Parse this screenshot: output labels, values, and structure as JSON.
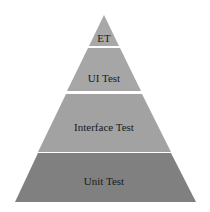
{
  "diagram": {
    "type": "test-pyramid",
    "layers": [
      {
        "label": "ET",
        "color": "#a8a8a8"
      },
      {
        "label": "UI Test",
        "color": "#a6a6a6"
      },
      {
        "label": "Interface Test",
        "color": "#a2a2a2"
      },
      {
        "label": "Unit Test",
        "color": "#808080"
      }
    ],
    "separator_color": "#ffffff"
  }
}
